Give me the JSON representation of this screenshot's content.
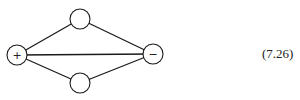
{
  "diagram": {
    "equation_label": "(7.26)",
    "stroke_color": "#1a1a1a",
    "nodes": [
      {
        "id": "plus",
        "label": "+",
        "cx": 17,
        "cy": 55,
        "r": 10
      },
      {
        "id": "top",
        "label": "",
        "cx": 80,
        "cy": 19,
        "r": 10
      },
      {
        "id": "bottom",
        "label": "",
        "cx": 80,
        "cy": 83,
        "r": 10
      },
      {
        "id": "minus",
        "label": "−",
        "cx": 153,
        "cy": 54,
        "r": 10
      }
    ],
    "edges": [
      {
        "from": "plus",
        "to": "top"
      },
      {
        "from": "plus",
        "to": "bottom"
      },
      {
        "from": "plus",
        "to": "minus"
      },
      {
        "from": "top",
        "to": "minus"
      },
      {
        "from": "bottom",
        "to": "minus"
      }
    ]
  }
}
